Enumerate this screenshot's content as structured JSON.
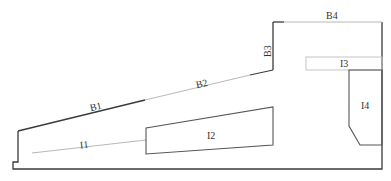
{
  "diagram": {
    "type": "cross-section outline",
    "colors": {
      "background": "#ffffff",
      "dark_line": "#3a3a3a",
      "light_line": "#b0b0b0",
      "label": "#333333"
    },
    "labels": {
      "B1": "B1",
      "B2": "B2",
      "B3": "B3",
      "B4": "B4",
      "I1": "I1",
      "I2": "I2",
      "I3": "I3",
      "I4": "I4"
    }
  }
}
